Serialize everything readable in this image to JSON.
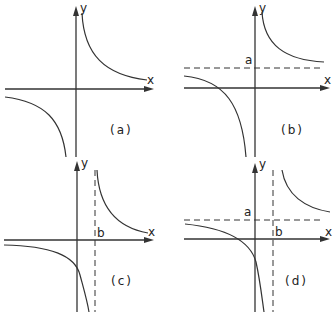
{
  "figure": {
    "panels": [
      {
        "id": "a",
        "caption": "(a)",
        "x_label": "x",
        "y_label": "y",
        "asymptote_labels": []
      },
      {
        "id": "b",
        "caption": "(b)",
        "x_label": "x",
        "y_label": "y",
        "asymptote_labels": [
          "a"
        ]
      },
      {
        "id": "c",
        "caption": "(c)",
        "x_label": "x",
        "y_label": "y",
        "asymptote_labels": [
          "b"
        ]
      },
      {
        "id": "d",
        "caption": "(d)",
        "x_label": "x",
        "y_label": "y",
        "asymptote_labels": [
          "a",
          "b"
        ]
      }
    ],
    "colors": {
      "line": "#333333",
      "background": "#ffffff"
    }
  }
}
